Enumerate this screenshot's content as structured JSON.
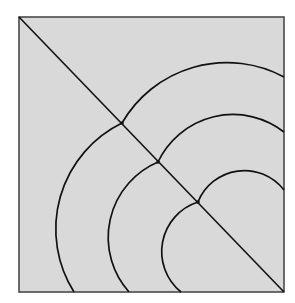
{
  "diagram": {
    "colors": {
      "background": "#ffffff",
      "fill": "#d9d9d9",
      "frame": "#4a4a4a",
      "line": "#111111"
    },
    "frame": {
      "x": 19,
      "y": 17,
      "width": 265,
      "height": 275
    },
    "diagonal": {
      "x1": 19,
      "y1": 17,
      "x2": 284,
      "y2": 292
    },
    "arcs": [
      {
        "name": "outer",
        "cusp": [
          122,
          123
        ],
        "upper": {
          "end": [
            284,
            77
          ],
          "r": 121
        },
        "lower": {
          "end": [
            74,
            292
          ],
          "r": 118
        }
      },
      {
        "name": "middle",
        "cusp": [
          158,
          162
        ],
        "upper": {
          "end": [
            284,
            132
          ],
          "r": 83
        },
        "lower": {
          "end": [
            129,
            292
          ],
          "r": 82
        }
      },
      {
        "name": "inner",
        "cusp": [
          198,
          202
        ],
        "upper": {
          "end": [
            284,
            190
          ],
          "r": 50
        },
        "lower": {
          "end": [
            181,
            292
          ],
          "r": 52
        }
      }
    ]
  }
}
